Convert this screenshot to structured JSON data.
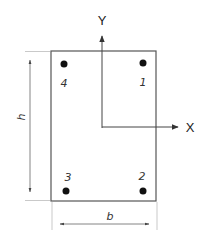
{
  "diagram": {
    "section": {
      "shape": "rectangle",
      "x": 51,
      "y": 51,
      "width": 105,
      "height": 150,
      "stroke": "#555555"
    },
    "axes": {
      "x_label": "X",
      "y_label": "Y",
      "origin": [
        102,
        127
      ],
      "color": "#333333"
    },
    "dimensions": {
      "height_label": "h",
      "width_label": "b"
    },
    "bars": [
      {
        "id": "1",
        "label": "1",
        "cx": 143,
        "cy": 63,
        "label_x": 143,
        "label_y": 86
      },
      {
        "id": "2",
        "label": "2",
        "cx": 143,
        "cy": 191,
        "label_x": 142,
        "label_y": 180
      },
      {
        "id": "3",
        "label": "3",
        "cx": 66,
        "cy": 191,
        "label_x": 68,
        "label_y": 181
      },
      {
        "id": "4",
        "label": "4",
        "cx": 64,
        "cy": 64,
        "label_x": 64,
        "label_y": 87
      }
    ],
    "bar_color": "#111111"
  }
}
